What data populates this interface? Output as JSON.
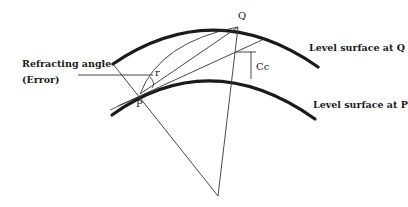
{
  "diagram": {
    "points": {
      "P": "P",
      "Q": "Q"
    },
    "labels": {
      "refracting_angle_line1": "Refracting angle",
      "refracting_angle_line2": "(Error)",
      "angle_r": "r",
      "curvature_correction": "Cc",
      "level_surface_q": "Level surface at Q",
      "level_surface_p": "Level surface at P"
    },
    "colors": {
      "stroke": "#1a1a1a",
      "background": "#ffffff"
    }
  }
}
